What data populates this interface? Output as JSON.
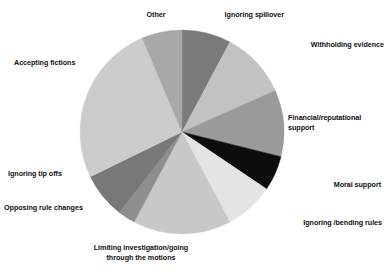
{
  "chart_data": {
    "type": "pie",
    "title": "",
    "subtitle": "",
    "xlabel": "",
    "ylabel": "",
    "legend_position": "none",
    "grid": false,
    "label_placement": "outside-callout",
    "start_angle_deg": 0,
    "direction": "clockwise",
    "units": "percent",
    "categories": [
      "Ignoring spillover",
      "Withholding evidence",
      "Financial/reputational\nsupport",
      "Moral support",
      "Ignoring /bending rules",
      "Limiting investigation/going\nthrough the motions",
      "Opposing rule changes",
      "Ignoring tip offs",
      "Accepting fictions",
      "Other"
    ],
    "values": [
      7.8,
      10.6,
      10.6,
      5.6,
      7.8,
      15.6,
      2.8,
      7.2,
      25.8,
      6.2
    ],
    "colors": [
      "#7a7a7a",
      "#c2c2c2",
      "#9a9a9a",
      "#0d0d0d",
      "#e4e4e4",
      "#c8c8c8",
      "#8e8e8e",
      "#787878",
      "#cccccc",
      "#a8a8a8"
    ],
    "slices": [
      {
        "label": "Ignoring spillover",
        "value": 7.8,
        "color": "#7a7a7a",
        "start_deg": 0,
        "end_deg": 28
      },
      {
        "label": "Withholding evidence",
        "value": 10.6,
        "color": "#c2c2c2",
        "start_deg": 28,
        "end_deg": 66
      },
      {
        "label": "Financial/reputational\nsupport",
        "value": 10.6,
        "color": "#9a9a9a",
        "start_deg": 66,
        "end_deg": 104
      },
      {
        "label": "Moral support",
        "value": 5.6,
        "color": "#0d0d0d",
        "start_deg": 104,
        "end_deg": 124
      },
      {
        "label": "Ignoring /bending rules",
        "value": 7.8,
        "color": "#e4e4e4",
        "start_deg": 124,
        "end_deg": 152
      },
      {
        "label": "Limiting investigation/going\nthrough the motions",
        "value": 15.6,
        "color": "#c8c8c8",
        "start_deg": 152,
        "end_deg": 208
      },
      {
        "label": "Opposing rule changes",
        "value": 2.8,
        "color": "#8e8e8e",
        "start_deg": 208,
        "end_deg": 218
      },
      {
        "label": "Ignoring tip offs",
        "value": 7.2,
        "color": "#787878",
        "start_deg": 218,
        "end_deg": 244
      },
      {
        "label": "Accepting fictions",
        "value": 25.8,
        "color": "#cccccc",
        "start_deg": 244,
        "end_deg": 337
      },
      {
        "label": "Other",
        "value": 6.2,
        "color": "#a8a8a8",
        "start_deg": 337,
        "end_deg": 360
      }
    ],
    "geometry": {
      "cx": 182,
      "cy": 132,
      "r": 102
    }
  },
  "labels": {
    "other": "Other",
    "ignoring_spillover": "Ignoring spillover",
    "withholding_evidence": "Withholding evidence",
    "financial_reputational_support": "Financial/reputational\nsupport",
    "moral_support": "Moral support",
    "ignoring_bending_rules": "Ignoring /bending rules",
    "limiting_investigation": "Limiting investigation/going\nthrough the motions",
    "opposing_rule_changes": "Opposing rule changes",
    "ignoring_tip_offs": "Ignoring tip offs",
    "accepting_fictions": "Accepting fictions"
  }
}
